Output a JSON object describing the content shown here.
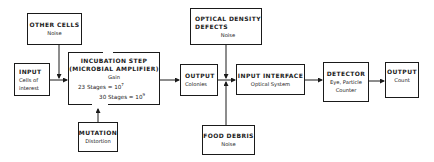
{
  "diagram": {
    "type": "block-flow",
    "nodes": {
      "other_cells": {
        "title": "OTHER CELLS",
        "sub": "Noise"
      },
      "input": {
        "title": "INPUT",
        "sub1": "Cells of",
        "sub2": "interest"
      },
      "incubation": {
        "title1": "INCUBATION STEP",
        "title2": "(MICROBIAL AMPLIFIER)",
        "gain_label": "Gain",
        "stage1_text": "23 Stages = 10",
        "stage1_exp": "7",
        "stage2_text": "30 Stages = 10",
        "stage2_exp": "9"
      },
      "mutation": {
        "title": "MUTATION",
        "sub": "Distortion"
      },
      "output_colonies": {
        "title": "OUTPUT",
        "sub": "Colonies"
      },
      "optical_density": {
        "title1": "OPTICAL DENSITY",
        "title2": "DEFECTS",
        "sub": "Noise"
      },
      "input_interface": {
        "title": "INPUT INTERFACE",
        "sub": "Optical System"
      },
      "food_debris": {
        "title": "FOOD DEBRIS",
        "sub": "Noise"
      },
      "detector": {
        "title": "DETECTOR",
        "sub1": "Eye, Particle",
        "sub2": "Counter"
      },
      "output_count": {
        "title": "OUTPUT",
        "sub": "Count"
      }
    },
    "edges": [
      {
        "from": "input",
        "to": "incubation"
      },
      {
        "from": "other_cells",
        "to": "incubation"
      },
      {
        "from": "mutation",
        "to": "incubation"
      },
      {
        "from": "incubation",
        "to": "output_colonies"
      },
      {
        "from": "output_colonies",
        "to": "input_interface"
      },
      {
        "from": "optical_density",
        "to": "input_interface"
      },
      {
        "from": "food_debris",
        "to": "input_interface"
      },
      {
        "from": "input_interface",
        "to": "detector"
      },
      {
        "from": "detector",
        "to": "output_count"
      }
    ],
    "line_color": "#1a1a1a"
  }
}
